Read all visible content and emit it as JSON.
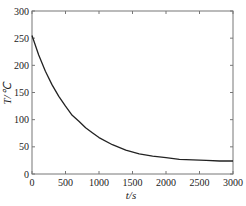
{
  "chart_data": {
    "type": "line",
    "title": "",
    "xlabel": "t/s",
    "ylabel": "T/℃",
    "xlim": [
      0,
      3000
    ],
    "ylim": [
      0,
      300
    ],
    "xticks": [
      0,
      500,
      1000,
      1500,
      2000,
      2500,
      3000
    ],
    "yticks": [
      0,
      50,
      100,
      150,
      200,
      250,
      300
    ],
    "grid": false,
    "legend": null,
    "series": [
      {
        "name": "T",
        "color": "#222222",
        "x": [
          0,
          100,
          200,
          300,
          400,
          500,
          600,
          700,
          800,
          900,
          1000,
          1200,
          1400,
          1600,
          1800,
          2000,
          2200,
          2400,
          2600,
          2800,
          3000
        ],
        "y": [
          255,
          219,
          189,
          164,
          143,
          125,
          108,
          97,
          85,
          76,
          67,
          54,
          44,
          37,
          33,
          30,
          27,
          26,
          25,
          24,
          24
        ]
      }
    ]
  }
}
